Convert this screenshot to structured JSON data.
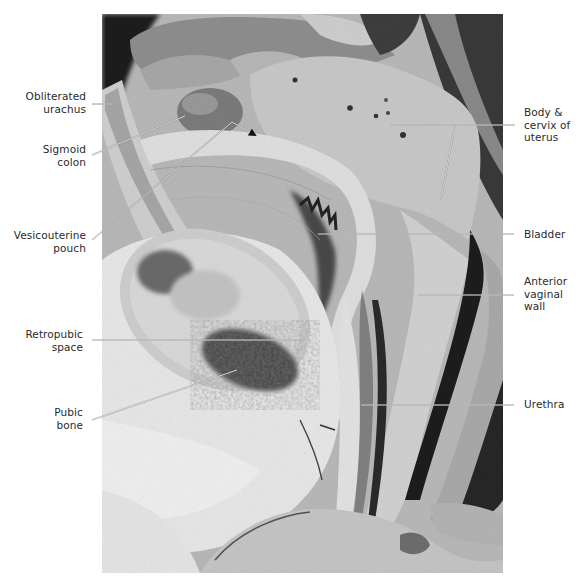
{
  "figure": {
    "type": "labeled anatomical photograph",
    "photo_bounds": {
      "x": 102,
      "y": 14,
      "width": 401,
      "height": 559
    },
    "leader_line_color": "#d8d8d8",
    "label_text_color": "#2a2a2a"
  },
  "labels": {
    "left": [
      {
        "id": "obliterated-urachus",
        "lines": [
          "Obliterated",
          "urachus"
        ],
        "x": 22,
        "y": 90,
        "w": 64,
        "leader": [
          [
            92,
            104
          ],
          [
            112,
            104
          ]
        ]
      },
      {
        "id": "sigmoid-colon",
        "lines": [
          "Sigmoid",
          "colon"
        ],
        "x": 22,
        "y": 144,
        "w": 64,
        "leader": [
          [
            92,
            155
          ],
          [
            185,
            116
          ]
        ]
      },
      {
        "id": "vesicouterine-pouch",
        "lines": [
          "Vesicouterine",
          "pouch"
        ],
        "x": 6,
        "y": 229,
        "w": 80,
        "leader": [
          [
            92,
            240
          ],
          [
            232,
            122
          ],
          [
            255,
            135
          ]
        ],
        "arrowhead": true
      },
      {
        "id": "retropubic-space",
        "lines": [
          "Retropubic",
          "space"
        ],
        "x": 12,
        "y": 328,
        "w": 70,
        "leader": [
          [
            92,
            340
          ],
          [
            305,
            340
          ]
        ]
      },
      {
        "id": "pubic-bone",
        "lines": [
          "Pubic",
          "bone"
        ],
        "x": 22,
        "y": 406,
        "w": 60,
        "leader": [
          [
            92,
            420
          ],
          [
            237,
            370
          ]
        ]
      }
    ],
    "right": [
      {
        "id": "body-cervix-uterus",
        "lines": [
          "Body &",
          "cervix of",
          "uterus"
        ],
        "x": 524,
        "y": 106,
        "leader": [
          [
            390,
            125
          ],
          [
            515,
            125
          ]
        ],
        "branch": [
          [
            455,
            125
          ],
          [
            441,
            200
          ]
        ]
      },
      {
        "id": "bladder",
        "lines": [
          "Bladder"
        ],
        "x": 524,
        "y": 228,
        "leader": [
          [
            318,
            234
          ],
          [
            514,
            234
          ]
        ]
      },
      {
        "id": "anterior-vaginal-wall",
        "lines": [
          "Anterior",
          "vaginal",
          "wall"
        ],
        "x": 524,
        "y": 275,
        "leader": [
          [
            418,
            295
          ],
          [
            514,
            295
          ]
        ]
      },
      {
        "id": "urethra",
        "lines": [
          "Urethra"
        ],
        "x": 524,
        "y": 398,
        "leader": [
          [
            361,
            405
          ],
          [
            514,
            405
          ]
        ]
      }
    ]
  }
}
